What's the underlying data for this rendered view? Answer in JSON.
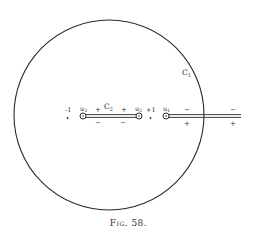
{
  "figure": {
    "caption": "Fig. 58.",
    "contour_outer_label": "C",
    "contour_outer_sub": "1",
    "contour_inner_label": "C",
    "contour_inner_sub": "2"
  },
  "points": {
    "minus_one": "-1",
    "plus_one": "+1",
    "u3": "u",
    "u3_sub": "3",
    "u2": "u",
    "u2_sub": "2",
    "u1": "u",
    "u1_sub": "1"
  },
  "signs": {
    "inner_upper_left": "+",
    "inner_upper_right": "+",
    "inner_lower_left": "−",
    "inner_lower_right": "−",
    "slit_upper_left": "−",
    "slit_upper_right": "−",
    "slit_lower_left": "+",
    "slit_lower_right": "+"
  },
  "colors": {
    "ink": "#2a2a2a",
    "background": "#ffffff"
  }
}
